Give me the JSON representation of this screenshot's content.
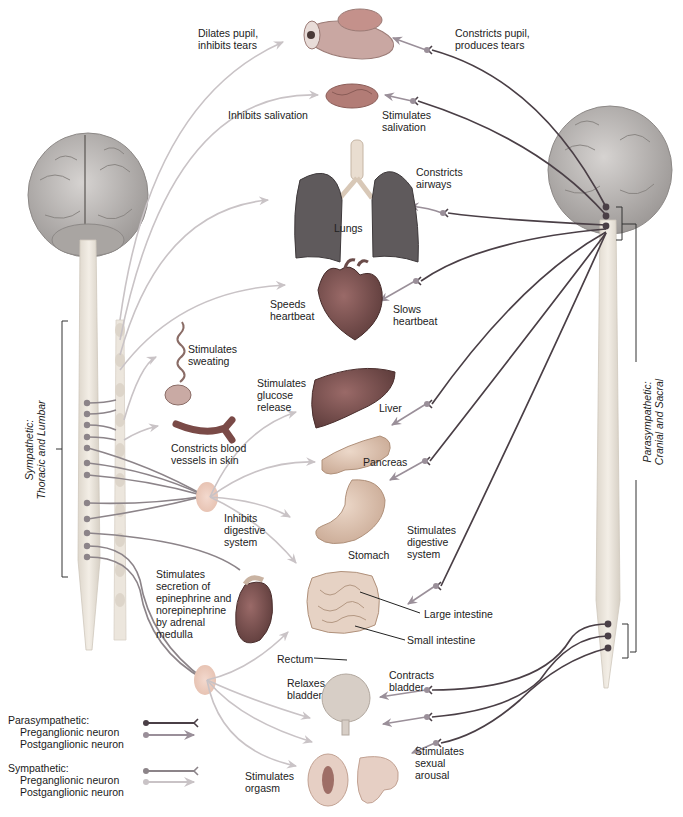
{
  "figure": {
    "colors": {
      "parasympathetic_preganglionic": "#4a3f46",
      "parasympathetic_postganglionic": "#9a8f99",
      "sympathetic_preganglionic": "#8c8489",
      "sympathetic_postganglionic": "#c9c3c6",
      "brain": "#b8b4b2",
      "spinal_cord": "#e8e2d8",
      "ganglion": "#efc9bb"
    }
  },
  "divisions": {
    "sympathetic": "Sympathetic:\nThoracic and Lumbar",
    "parasympathetic": "Parasympathetic:\nCranial and Sacral"
  },
  "organs": {
    "lungs": "Lungs",
    "liver": "Liver",
    "pancreas": "Pancreas",
    "stomach": "Stomach",
    "large_intestine": "Large intestine",
    "small_intestine": "Small intestine",
    "rectum": "Rectum"
  },
  "sympathetic_effects": {
    "eye": "Dilates pupil,\ninhibits tears",
    "salivary": "Inhibits salivation",
    "heart": "Speeds\nheartbeat",
    "sweat": "Stimulates\nsweating",
    "vessels": "Constricts blood\nvessels in skin",
    "liver": "Stimulates\nglucose\nrelease",
    "digestive": "Inhibits\ndigestive\nsystem",
    "adrenal": "Stimulates\nsecretion of\nepinephrine and\nnorepinephrine\nby adrenal\nmedulla",
    "bladder": "Relaxes\nbladder",
    "genitals": "Stimulates\norgasm"
  },
  "parasympathetic_effects": {
    "eye": "Constricts pupil,\nproduces tears",
    "salivary": "Stimulates\nsalivation",
    "airways": "Constricts\nairways",
    "heart": "Slows\nheartbeat",
    "digestive": "Stimulates\ndigestive\nsystem",
    "bladder": "Contracts\nbladder",
    "genitals": "Stimulates\nsexual\narousal"
  },
  "legend": {
    "parasympathetic_header": "Parasympathetic:",
    "parasympathetic_pre": "Preganglionic neuron",
    "parasympathetic_post": "Postganglionic neuron",
    "sympathetic_header": "Sympathetic:",
    "sympathetic_pre": "Preganglionic neuron",
    "sympathetic_post": "Postganglionic neuron"
  }
}
